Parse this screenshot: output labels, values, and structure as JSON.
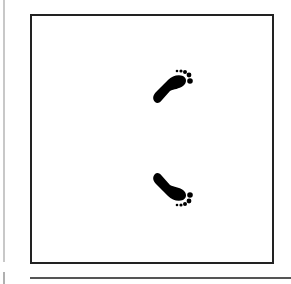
{
  "figure": {
    "icons": [
      "footprint-icon-upper",
      "footprint-icon-lower"
    ],
    "colors": {
      "frame": "#222222",
      "ink": "#000000",
      "background": "#ffffff",
      "rule": "#555555"
    }
  }
}
